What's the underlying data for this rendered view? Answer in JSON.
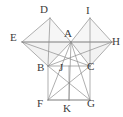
{
  "figure": {
    "width": 123,
    "height": 117,
    "background_color": "#ffffff",
    "stroke_color": "#8c8c8c",
    "label_color": "#3b3b3b",
    "fill_color": "#efefef",
    "fill_opacity": 0.55,
    "stroke_width": 0.7
  },
  "points": {
    "A": {
      "label": "A",
      "x": 71,
      "y": 42,
      "label_x": 64,
      "label_y": 28
    },
    "B": {
      "label": "B",
      "x": 48,
      "y": 66,
      "label_x": 37,
      "label_y": 62
    },
    "C": {
      "label": "C",
      "x": 90,
      "y": 66,
      "label_x": 87,
      "label_y": 61
    },
    "D": {
      "label": "D",
      "x": 50,
      "y": 18,
      "label_x": 40,
      "label_y": 4
    },
    "E": {
      "label": "E",
      "x": 22,
      "y": 42,
      "label_x": 10,
      "label_y": 32
    },
    "F": {
      "label": "F",
      "x": 48,
      "y": 100,
      "label_x": 37,
      "label_y": 98
    },
    "G": {
      "label": "G",
      "x": 90,
      "y": 100,
      "label_x": 87,
      "label_y": 98
    },
    "H": {
      "label": "H",
      "x": 112,
      "y": 42,
      "label_x": 112,
      "label_y": 36
    },
    "I": {
      "label": "I",
      "x": 90,
      "y": 18,
      "label_x": 86,
      "label_y": 5
    },
    "J": {
      "label": "J",
      "x": 69,
      "y": 66,
      "label_x": 59,
      "label_y": 62
    },
    "K": {
      "label": "K",
      "x": 69,
      "y": 100,
      "label_x": 63,
      "label_y": 103
    }
  },
  "filled_regions": [
    {
      "name": "left-square-region",
      "polygon": "22,42 50,18 71,42 48,66"
    },
    {
      "name": "right-square-region",
      "polygon": "71,42 90,18 112,42 90,66"
    },
    {
      "name": "triangle-eab-region",
      "polygon": "22,42 71,42 48,66"
    },
    {
      "name": "triangle-ahc-region",
      "polygon": "71,42 112,42 90,66"
    }
  ],
  "segments": [
    {
      "name": "segment-E-D",
      "from": "E",
      "to": "D"
    },
    {
      "name": "segment-D-A",
      "from": "D",
      "to": "A"
    },
    {
      "name": "segment-A-B",
      "from": "A",
      "to": "B"
    },
    {
      "name": "segment-B-E",
      "from": "B",
      "to": "E"
    },
    {
      "name": "segment-E-A",
      "from": "E",
      "to": "A"
    },
    {
      "name": "segment-D-B",
      "from": "D",
      "to": "B"
    },
    {
      "name": "segment-A-I",
      "from": "A",
      "to": "I"
    },
    {
      "name": "segment-I-H",
      "from": "I",
      "to": "H"
    },
    {
      "name": "segment-H-C",
      "from": "H",
      "to": "C"
    },
    {
      "name": "segment-C-A",
      "from": "C",
      "to": "A"
    },
    {
      "name": "segment-A-H",
      "from": "A",
      "to": "H"
    },
    {
      "name": "segment-I-C",
      "from": "I",
      "to": "C"
    },
    {
      "name": "segment-B-C",
      "from": "B",
      "to": "C"
    },
    {
      "name": "segment-B-F",
      "from": "B",
      "to": "F"
    },
    {
      "name": "segment-F-G",
      "from": "F",
      "to": "G"
    },
    {
      "name": "segment-G-C",
      "from": "G",
      "to": "C"
    },
    {
      "name": "segment-B-G",
      "from": "B",
      "to": "G"
    },
    {
      "name": "segment-F-C",
      "from": "F",
      "to": "C"
    },
    {
      "name": "segment-A-F",
      "from": "A",
      "to": "F"
    },
    {
      "name": "segment-A-G",
      "from": "A",
      "to": "G"
    },
    {
      "name": "segment-A-K",
      "from": "A",
      "to": "K"
    },
    {
      "name": "segment-J-K",
      "from": "J",
      "to": "K"
    },
    {
      "name": "segment-E-H",
      "from": "E",
      "to": "H"
    },
    {
      "name": "segment-E-C",
      "from": "E",
      "to": "C"
    },
    {
      "name": "segment-B-H",
      "from": "B",
      "to": "H"
    },
    {
      "name": "segment-F-K",
      "from": "F",
      "to": "K"
    },
    {
      "name": "segment-K-G",
      "from": "K",
      "to": "G"
    }
  ]
}
